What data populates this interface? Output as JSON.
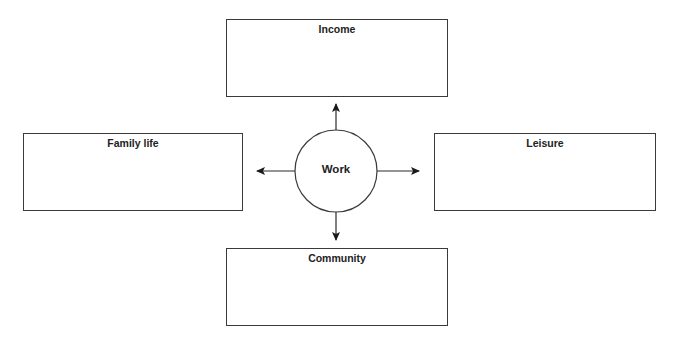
{
  "diagram": {
    "center": {
      "label": "Work",
      "cx": 336,
      "cy": 171,
      "r": 41
    },
    "nodes": [
      {
        "id": "income",
        "label": "Income",
        "x": 226,
        "y": 19,
        "w": 222,
        "h": 78
      },
      {
        "id": "family",
        "label": "Family life",
        "x": 23,
        "y": 133,
        "w": 220,
        "h": 78
      },
      {
        "id": "leisure",
        "label": "Leisure",
        "x": 434,
        "y": 133,
        "w": 222,
        "h": 78
      },
      {
        "id": "community",
        "label": "Community",
        "x": 226,
        "y": 248,
        "w": 222,
        "h": 78
      }
    ],
    "arrows": [
      {
        "to": "income",
        "x1": 336,
        "y1": 130,
        "x2": 336,
        "y2": 104
      },
      {
        "to": "community",
        "x1": 336,
        "y1": 212,
        "x2": 336,
        "y2": 240
      },
      {
        "to": "family",
        "x1": 295,
        "y1": 171,
        "x2": 257,
        "y2": 171
      },
      {
        "to": "leisure",
        "x1": 377,
        "y1": 171,
        "x2": 419,
        "y2": 171
      }
    ],
    "colors": {
      "stroke": "#3a3a3a",
      "text": "#222222",
      "background": "#ffffff"
    }
  }
}
